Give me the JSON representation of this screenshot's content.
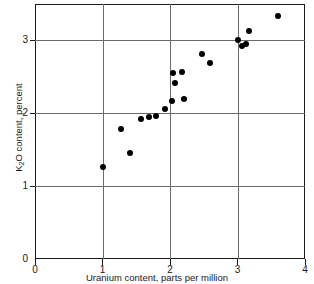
{
  "chart_data": {
    "type": "scatter",
    "title": "",
    "xlabel": "Uranium content, parts per million",
    "ylabel_parts": {
      "prefix": "K",
      "subscript": "2",
      "suffix": "O content, percent"
    },
    "ylabel": "K2O content, percent",
    "xlim": [
      0,
      4
    ],
    "ylim": [
      0,
      3.5
    ],
    "xticks": [
      0,
      1,
      2,
      3,
      4
    ],
    "yticks": [
      0,
      1,
      2,
      3
    ],
    "xticklabels": [
      "0",
      "1",
      "2",
      "3",
      "4"
    ],
    "yticklabels": [
      "0",
      "1",
      "2",
      "3"
    ],
    "grid": "major-gridlines-at-labeled-ticks",
    "legend": "none",
    "marker": "filled-circle",
    "marker_color": "#000000",
    "points": [
      {
        "x": 1.0,
        "y": 1.26
      },
      {
        "x": 1.28,
        "y": 1.78
      },
      {
        "x": 1.4,
        "y": 1.46
      },
      {
        "x": 1.57,
        "y": 1.92
      },
      {
        "x": 1.69,
        "y": 1.95
      },
      {
        "x": 1.79,
        "y": 1.96
      },
      {
        "x": 1.92,
        "y": 2.06
      },
      {
        "x": 2.03,
        "y": 2.17
      },
      {
        "x": 2.05,
        "y": 2.55
      },
      {
        "x": 2.07,
        "y": 2.41
      },
      {
        "x": 2.18,
        "y": 2.56
      },
      {
        "x": 2.21,
        "y": 2.19
      },
      {
        "x": 2.48,
        "y": 2.82
      },
      {
        "x": 2.59,
        "y": 2.69
      },
      {
        "x": 3.01,
        "y": 3.0
      },
      {
        "x": 3.06,
        "y": 2.93
      },
      {
        "x": 3.13,
        "y": 2.95
      },
      {
        "x": 3.17,
        "y": 3.13
      },
      {
        "x": 3.6,
        "y": 3.33
      }
    ]
  }
}
